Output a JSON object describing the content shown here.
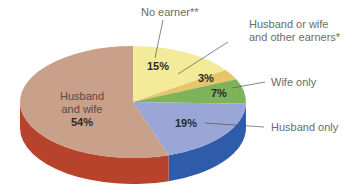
{
  "chart_data": {
    "type": "pie",
    "style": "3d-pie",
    "title": "",
    "slices": [
      {
        "label": "No earner**",
        "value": 15,
        "display": "15%",
        "color": "#f3eb9a",
        "side_color": "#d9cf70"
      },
      {
        "label": "Husband or wife and other earners*",
        "value": 3,
        "display": "3%",
        "color": "#e8c46a",
        "side_color": "#c9a04a"
      },
      {
        "label": "Wife only",
        "value": 7,
        "display": "7%",
        "color": "#7fb35a",
        "side_color": "#5b8e3c"
      },
      {
        "label": "Husband only",
        "value": 19,
        "display": "19%",
        "color": "#9aa6d6",
        "side_color": "#2f5ca8"
      },
      {
        "label": "Husband and wife",
        "value": 54,
        "display": "54%",
        "color": "#c9a08a",
        "side_color": "#b8432c"
      }
    ],
    "start_angle": "12 o'clock",
    "direction": "clockwise",
    "legend": "callout labels"
  },
  "labels": {
    "no_earner": "No earner**",
    "other_earners_line1": "Husband or wife",
    "other_earners_line2": "and other earners*",
    "wife_only": "Wife only",
    "husband_only": "Husband only",
    "husband_wife_line1": "Husband",
    "husband_wife_line2": "and wife"
  },
  "percents": {
    "no_earner": "15%",
    "other_earners": "3%",
    "wife_only": "7%",
    "husband_only": "19%",
    "husband_wife": "54%"
  }
}
